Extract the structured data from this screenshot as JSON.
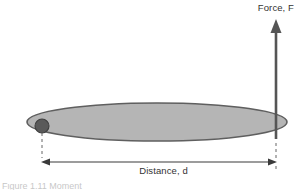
{
  "figure": {
    "force_label": "Force, F",
    "distance_label": "Distance, d",
    "caption": "Figure 1.11  Moment",
    "colors": {
      "background": "#ffffff",
      "lever_fill": "#b5b5b5",
      "lever_stroke": "#5f5f5f",
      "pivot_fill": "#5a5a5a",
      "pivot_stroke": "#3f3f3f",
      "arrow": "#555555",
      "dimension_line": "#3a3a3a",
      "extension_line": "#666666",
      "text": "#333333"
    },
    "lever": {
      "shape": "ellipse",
      "center_x": 157,
      "center_y": 122,
      "radius_x": 130,
      "radius_y": 19
    },
    "pivot": {
      "shape": "circle",
      "center_x": 42,
      "center_y": 126,
      "radius": 7
    },
    "force_arrow": {
      "direction": "up",
      "x": 276,
      "tail_y": 139,
      "tip_y": 20,
      "head_width": 11,
      "head_height": 13,
      "shaft_width": 2.6
    },
    "dimension": {
      "y": 162,
      "x_start": 42,
      "x_end": 276,
      "extension_top_left_y": 133,
      "extension_top_right_y": 116,
      "extension_bottom_y": 170
    }
  }
}
